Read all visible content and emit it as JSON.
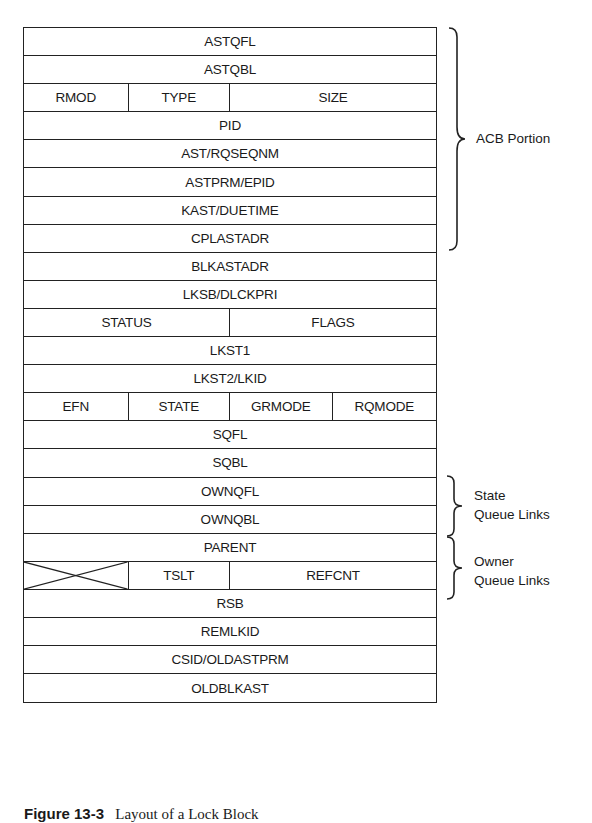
{
  "diagram": {
    "rows": [
      {
        "cells": [
          {
            "label": "ASTQFL",
            "width": 414
          }
        ]
      },
      {
        "cells": [
          {
            "label": "ASTQBL",
            "width": 414
          }
        ]
      },
      {
        "cells": [
          {
            "label": "RMOD",
            "width": 105
          },
          {
            "label": "TYPE",
            "width": 102
          },
          {
            "label": "SIZE",
            "width": 207
          }
        ]
      },
      {
        "cells": [
          {
            "label": "PID",
            "width": 414
          }
        ]
      },
      {
        "cells": [
          {
            "label": "AST/RQSEQNM",
            "width": 414
          }
        ]
      },
      {
        "cells": [
          {
            "label": "ASTPRM/EPID",
            "width": 414
          }
        ]
      },
      {
        "cells": [
          {
            "label": "KAST/DUETIME",
            "width": 414
          }
        ]
      },
      {
        "cells": [
          {
            "label": "CPLASTADR",
            "width": 414
          }
        ]
      },
      {
        "cells": [
          {
            "label": "BLKASTADR",
            "width": 414
          }
        ]
      },
      {
        "cells": [
          {
            "label": "LKSB/DLCKPRI",
            "width": 414
          }
        ]
      },
      {
        "cells": [
          {
            "label": "STATUS",
            "width": 207
          },
          {
            "label": "FLAGS",
            "width": 207
          }
        ]
      },
      {
        "cells": [
          {
            "label": "LKST1",
            "width": 414
          }
        ]
      },
      {
        "cells": [
          {
            "label": "LKST2/LKID",
            "width": 414
          }
        ]
      },
      {
        "cells": [
          {
            "label": "EFN",
            "width": 105
          },
          {
            "label": "STATE",
            "width": 102
          },
          {
            "label": "GRMODE",
            "width": 103
          },
          {
            "label": "RQMODE",
            "width": 104
          }
        ]
      },
      {
        "cells": [
          {
            "label": "SQFL",
            "width": 414
          }
        ]
      },
      {
        "cells": [
          {
            "label": "SQBL",
            "width": 414
          }
        ]
      },
      {
        "cells": [
          {
            "label": "OWNQFL",
            "width": 414
          }
        ]
      },
      {
        "cells": [
          {
            "label": "OWNQBL",
            "width": 414
          }
        ]
      },
      {
        "cells": [
          {
            "label": "PARENT",
            "width": 414
          }
        ]
      },
      {
        "cells": [
          {
            "label": "",
            "width": 105,
            "crossed": true
          },
          {
            "label": "TSLT",
            "width": 102
          },
          {
            "label": "REFCNT",
            "width": 207
          }
        ]
      },
      {
        "cells": [
          {
            "label": "RSB",
            "width": 414
          }
        ]
      },
      {
        "cells": [
          {
            "label": "REMLKID",
            "width": 414
          }
        ]
      },
      {
        "cells": [
          {
            "label": "CSID/OLDASTPRM",
            "width": 414
          }
        ]
      },
      {
        "cells": [
          {
            "label": "OLDBLKAST",
            "width": 414
          }
        ]
      }
    ],
    "braces": [
      {
        "label_lines": [
          "ACB Portion"
        ],
        "from_row": 0,
        "to_row": 6
      },
      {
        "label_lines": [
          "State",
          "Queue Links"
        ],
        "from_row": 14,
        "to_row": 15
      },
      {
        "label_lines": [
          "Owner",
          "Queue Links"
        ],
        "from_row": 16,
        "to_row": 17
      }
    ],
    "caption": {
      "number": "Figure 13-3",
      "text": "Layout of a Lock Block"
    }
  }
}
